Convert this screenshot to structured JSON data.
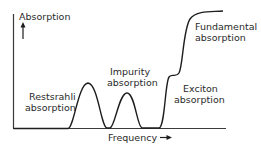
{
  "diagram": {
    "y_axis_label": "Absorption",
    "x_axis_label": "Frequency",
    "x_axis_arrow": "→",
    "y_axis_arrow": "↑",
    "regions": [
      {
        "name": "restsrahli",
        "line1": "Restsrahli",
        "line2": "absorption"
      },
      {
        "name": "impurity",
        "line1": "Impurity",
        "line2": "absorption"
      },
      {
        "name": "exciton",
        "line1": "Exciton",
        "line2": "absorption"
      },
      {
        "name": "fundamental",
        "line1": "Fundamental",
        "line2": "absorption"
      }
    ],
    "colors": {
      "line": "#1e1e1e",
      "text": "#2a2a2a",
      "axis": "#3a3a3a"
    }
  }
}
